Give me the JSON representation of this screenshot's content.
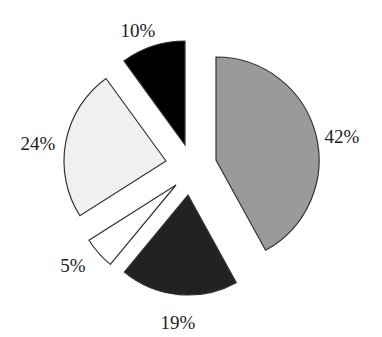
{
  "chart_data": {
    "type": "pie",
    "title": "",
    "exploded": true,
    "slices": [
      {
        "label": "42%",
        "value": 42,
        "color": "#9a9a9a",
        "start_deg": 0,
        "end_deg": 151.2,
        "cx": 216,
        "cy": 160,
        "r": 103,
        "label_x": 342,
        "label_y": 143
      },
      {
        "label": "19%",
        "value": 19,
        "color": "#222222",
        "start_deg": 151.2,
        "end_deg": 219.6,
        "cx": 188,
        "cy": 195,
        "r": 100,
        "label_x": 178,
        "label_y": 329
      },
      {
        "label": "5%",
        "value": 5,
        "color": "#ffffff",
        "start_deg": 219.6,
        "end_deg": 237.6,
        "cx": 176,
        "cy": 185,
        "r": 103,
        "label_x": 73,
        "label_y": 272
      },
      {
        "label": "24%",
        "value": 24,
        "color": "#f0f0f0",
        "start_deg": 237.6,
        "end_deg": 324,
        "cx": 166,
        "cy": 161,
        "r": 102,
        "label_x": 38,
        "label_y": 150
      },
      {
        "label": "10%",
        "value": 10,
        "color": "#000000",
        "start_deg": 324,
        "end_deg": 360,
        "cx": 185,
        "cy": 145,
        "r": 104,
        "label_x": 138,
        "label_y": 37
      }
    ],
    "legend": null,
    "stroke_color": "#333333"
  }
}
